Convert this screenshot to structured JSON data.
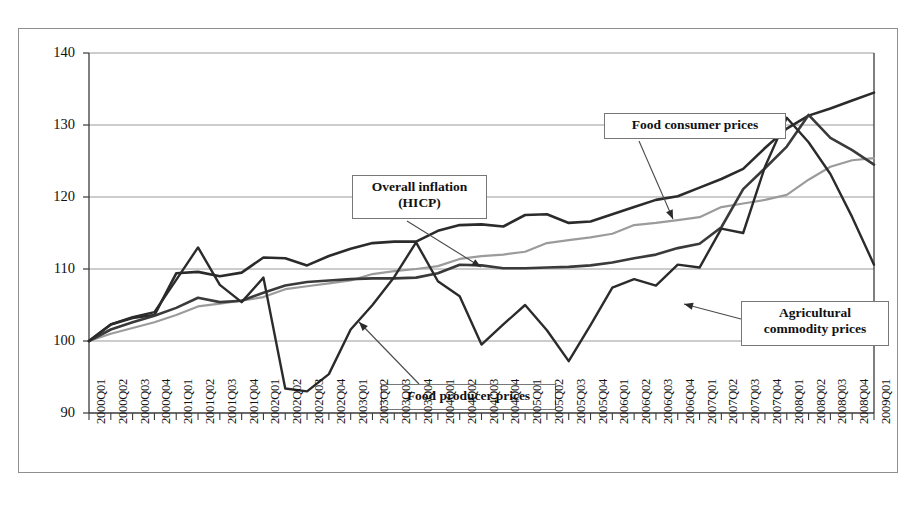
{
  "chart_data": {
    "type": "line",
    "title": "",
    "subtitle": "",
    "xlabel": "",
    "ylabel": "",
    "ylim": [
      90,
      140
    ],
    "yticks": [
      90,
      100,
      110,
      120,
      130,
      140
    ],
    "grid": true,
    "legend_position": "inline-annotations",
    "index_base": "2000Q1 = 100",
    "categories": [
      "2000Q01",
      "2000Q02",
      "2000Q03",
      "2000Q04",
      "2001Q01",
      "2001Q02",
      "2001Q03",
      "2001Q04",
      "2002Q01",
      "2002Q02",
      "2002Q03",
      "2002Q04",
      "2003Q01",
      "2003Q02",
      "2003Q03",
      "2003Q04",
      "2004Q01",
      "2004Q02",
      "2004Q03",
      "2004Q04",
      "2005Q01",
      "2005Q02",
      "2005Q03",
      "2005Q04",
      "2006Q01",
      "2006Q02",
      "2006Q03",
      "2006Q04",
      "2007Q01",
      "2007Q02",
      "2007Q03",
      "2007Q04",
      "2008Q01",
      "2008Q02",
      "2008Q03",
      "2008Q04",
      "2009Q01"
    ],
    "series": [
      {
        "name": "Food consumer prices",
        "color": "#2b2b2b",
        "width": 2.6,
        "values": [
          100.0,
          102.3,
          103.2,
          103.6,
          109.4,
          109.6,
          109.0,
          109.5,
          111.6,
          111.5,
          110.5,
          111.8,
          112.8,
          113.6,
          113.8,
          113.8,
          115.3,
          116.1,
          116.2,
          115.9,
          117.5,
          117.6,
          116.4,
          116.6,
          117.6,
          118.6,
          119.6,
          120.1,
          121.3,
          122.5,
          123.9,
          126.8,
          129.5,
          131.3,
          132.3,
          133.4,
          134.5
        ]
      },
      {
        "name": "Overall inflation (HICP)",
        "color": "#9b9b9b",
        "width": 2.2,
        "values": [
          100.0,
          101.0,
          101.8,
          102.6,
          103.6,
          104.8,
          105.2,
          105.6,
          106.1,
          107.2,
          107.6,
          108.0,
          108.4,
          109.3,
          109.7,
          110.0,
          110.4,
          111.4,
          111.8,
          112.0,
          112.4,
          113.6,
          114.0,
          114.4,
          114.9,
          116.1,
          116.4,
          116.8,
          117.2,
          118.6,
          119.1,
          119.6,
          120.3,
          122.4,
          124.2,
          125.1,
          125.4
        ]
      },
      {
        "name": "Food producer prices",
        "color": "#3a3a3a",
        "width": 2.6,
        "values": [
          100.0,
          101.6,
          102.6,
          103.5,
          104.6,
          106.0,
          105.4,
          105.6,
          106.7,
          107.7,
          108.2,
          108.4,
          108.6,
          108.7,
          108.7,
          108.8,
          109.4,
          110.6,
          110.5,
          110.1,
          110.1,
          110.2,
          110.3,
          110.5,
          110.9,
          111.5,
          112.0,
          112.9,
          113.5,
          115.8,
          121.1,
          124.0,
          127.0,
          131.4,
          128.2,
          126.5,
          124.5
        ]
      },
      {
        "name": "Agricultural commodity prices",
        "color": "#2b2b2b",
        "width": 2.4,
        "values": [
          100.0,
          102.3,
          103.3,
          104.0,
          108.5,
          113.0,
          107.8,
          105.4,
          108.8,
          93.4,
          93.0,
          95.4,
          101.6,
          105.0,
          108.9,
          113.7,
          108.3,
          106.2,
          99.5,
          102.3,
          105.0,
          101.5,
          97.2,
          102.2,
          107.4,
          108.6,
          107.7,
          110.6,
          110.2,
          115.6,
          115.0,
          124.2,
          131.0,
          127.6,
          123.2,
          117.2,
          110.6
        ]
      }
    ],
    "annotations": [
      {
        "id": "food-consumer-prices",
        "text": "Food consumer prices",
        "box": {
          "x": 585,
          "y": 84,
          "w": 182,
          "h": 26
        },
        "arrow": {
          "x1": 620,
          "y1": 112,
          "x2": 654,
          "y2": 190
        }
      },
      {
        "id": "overall-inflation-hicp",
        "text": "Overall inflation\n(HICP)",
        "box": {
          "x": 333,
          "y": 146,
          "w": 135,
          "h": 44
        },
        "arrow": {
          "x1": 388,
          "y1": 192,
          "x2": 462,
          "y2": 238
        }
      },
      {
        "id": "food-producer-prices",
        "text": "Food producer prices",
        "box": {
          "x": 362,
          "y": 355,
          "w": 175,
          "h": 26
        },
        "arrow": {
          "x1": 400,
          "y1": 355,
          "x2": 340,
          "y2": 293
        }
      },
      {
        "id": "agricultural-commodity-prices",
        "text": "Agricultural\ncommodity prices",
        "box": {
          "x": 722,
          "y": 272,
          "w": 148,
          "h": 45
        },
        "arrow": {
          "x1": 722,
          "y1": 290,
          "x2": 665,
          "y2": 275
        }
      }
    ]
  }
}
